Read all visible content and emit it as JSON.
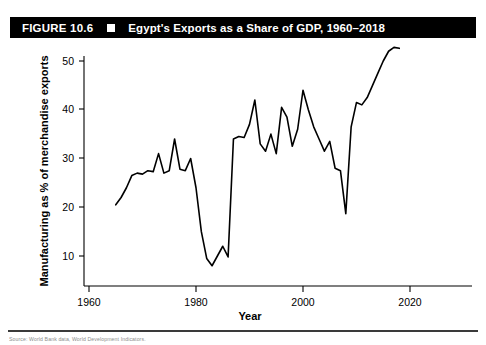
{
  "figure": {
    "number_label": "FIGURE 10.6",
    "bullet_icon": "square-bullet-icon",
    "title": "Egypt's Exports as a Share of GDP, 1960–2018",
    "source_note": "Source: World Bank data, World Development Indicators."
  },
  "chart_data": {
    "type": "line",
    "title": "Egypt's Exports as a Share of GDP, 1960–2018",
    "xlabel": "Year",
    "ylabel": "Manufacturing as % of merchandise exports",
    "xlim": [
      1958,
      2022
    ],
    "ylim": [
      5,
      55
    ],
    "xticks": [
      1960,
      1980,
      2000,
      2020
    ],
    "yticks": [
      10,
      20,
      30,
      40,
      50
    ],
    "grid": false,
    "legend": "none",
    "line_color": "#000000",
    "x": [
      1965,
      1966,
      1967,
      1968,
      1969,
      1970,
      1971,
      1972,
      1973,
      1974,
      1975,
      1976,
      1977,
      1978,
      1979,
      1980,
      1981,
      1982,
      1983,
      1984,
      1985,
      1986,
      1987,
      1988,
      1989,
      1990,
      1991,
      1992,
      1993,
      1994,
      1995,
      1996,
      1997,
      1998,
      1999,
      2000,
      2001,
      2002,
      2003,
      2004,
      2005,
      2006,
      2007,
      2008,
      2009,
      2010,
      2011,
      2012,
      2013,
      2014,
      2015,
      2016,
      2017,
      2018
    ],
    "values": [
      20.5,
      22.0,
      24.0,
      26.5,
      27.0,
      26.8,
      27.5,
      27.3,
      31.0,
      27.0,
      27.5,
      34.0,
      27.8,
      27.5,
      30.0,
      24.0,
      15.0,
      9.5,
      8.0,
      10.0,
      12.0,
      9.8,
      34.0,
      34.5,
      34.3,
      37.0,
      42.0,
      33.0,
      31.5,
      35.0,
      31.0,
      40.5,
      38.5,
      32.5,
      36.0,
      44.0,
      40.0,
      36.5,
      34.0,
      31.5,
      33.5,
      28.0,
      27.5,
      18.7,
      36.5,
      41.5,
      41.0,
      42.5,
      45.0,
      47.5,
      50.0,
      52.0,
      52.8,
      52.6
    ]
  },
  "axis": {
    "x_tick_labels": [
      "1960",
      "1980",
      "2000",
      "2020"
    ],
    "y_tick_labels": [
      "10",
      "20",
      "30",
      "40",
      "50"
    ],
    "x_axis_title": "Year",
    "y_axis_title": "Manufacturing as % of merchandise exports"
  }
}
